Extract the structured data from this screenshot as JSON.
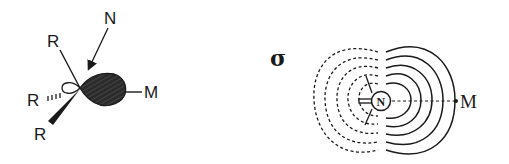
{
  "left_panel": {
    "labels": {
      "nucleophile": "N",
      "r_top": "R",
      "r_left": "R",
      "r_bottom": "R",
      "metal": "M"
    }
  },
  "right_panel": {
    "labels": {
      "bond_type": "σ",
      "center": "N",
      "metal": "M"
    }
  },
  "colors": {
    "ink": "#1a1a1a",
    "lobe_fill": "#2b2b2b",
    "background": "#ffffff"
  }
}
